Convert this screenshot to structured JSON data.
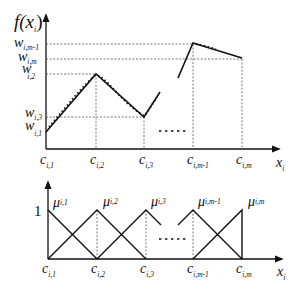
{
  "top_plot": {
    "y_axis_label": "f(x",
    "y_axis_sub": "i",
    "y_axis_close": ")",
    "x_axis_label": "x",
    "x_axis_sub": "i",
    "y_ticks": [
      {
        "base": "w",
        "sub": "i,m-1"
      },
      {
        "base": "w",
        "sub": "i,m"
      },
      {
        "base": "w",
        "sub": "i,2"
      },
      {
        "base": "w",
        "sub": "i,3"
      },
      {
        "base": "w",
        "sub": "i,1"
      }
    ],
    "x_ticks": [
      {
        "base": "c",
        "sub": "i,1"
      },
      {
        "base": "c",
        "sub": "i,2"
      },
      {
        "base": "c",
        "sub": "i,3"
      },
      {
        "base": "c",
        "sub": "i,m-1"
      },
      {
        "base": "c",
        "sub": "i,m"
      }
    ]
  },
  "bottom_plot": {
    "y_tick_one": "1",
    "x_axis_label": "x",
    "x_axis_sub": "i",
    "mf_labels": [
      {
        "base": "μ",
        "sub": "i,1"
      },
      {
        "base": "μ",
        "sub": "i,2"
      },
      {
        "base": "μ",
        "sub": "i,3"
      },
      {
        "base": "μ",
        "sub": "i,m-1"
      },
      {
        "base": "μ",
        "sub": "i,m"
      }
    ],
    "x_ticks": [
      {
        "base": "c",
        "sub": "i,1"
      },
      {
        "base": "c",
        "sub": "i,2"
      },
      {
        "base": "c",
        "sub": "i,3"
      },
      {
        "base": "c",
        "sub": "i,m-1"
      },
      {
        "base": "c",
        "sub": "i,m"
      }
    ]
  }
}
